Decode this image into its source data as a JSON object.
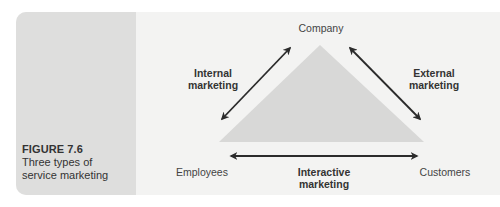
{
  "figure": {
    "label": "FIGURE 7.6",
    "title_line1": "Three types of",
    "title_line2": "service marketing"
  },
  "nodes": {
    "top": "Company",
    "bottom_left": "Employees",
    "bottom_right": "Customers"
  },
  "relationships": {
    "internal": {
      "line1": "Internal",
      "line2": "marketing",
      "between": [
        "Company",
        "Employees"
      ]
    },
    "external": {
      "line1": "External",
      "line2": "marketing",
      "between": [
        "Company",
        "Customers"
      ]
    },
    "interactive": {
      "line1": "Interactive",
      "line2": "marketing",
      "between": [
        "Employees",
        "Customers"
      ]
    }
  },
  "colors": {
    "panel_background": "#f3f3f2",
    "caption_background": "#dededd",
    "triangle_fill": "#d8d8d7",
    "arrow_color": "#2b2b2b",
    "text_color": "#333333"
  }
}
